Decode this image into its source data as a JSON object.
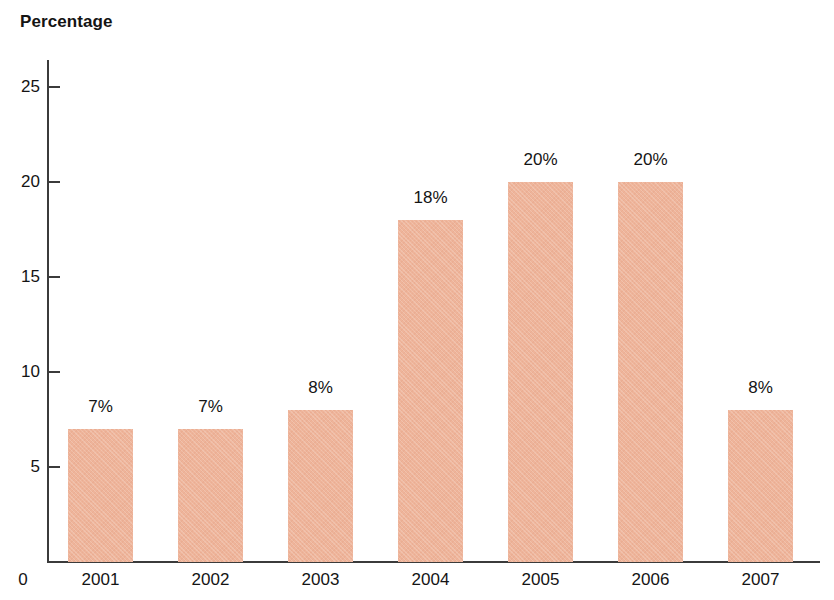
{
  "chart_data": {
    "type": "bar",
    "title": "Percentage",
    "xlabel": "",
    "ylabel": "Percentage",
    "categories": [
      "2001",
      "2002",
      "2003",
      "2004",
      "2005",
      "2006",
      "2007"
    ],
    "values": [
      7,
      7,
      8,
      18,
      20,
      20,
      8
    ],
    "value_labels": [
      "7%",
      "7%",
      "8%",
      "18%",
      "20%",
      "20%",
      "8%"
    ],
    "ylim": [
      0,
      25
    ],
    "yticks": [
      5,
      10,
      15,
      20,
      25
    ],
    "ytick_labels": [
      "5",
      "10",
      "15",
      "20",
      "25"
    ],
    "origin_label": "0",
    "grid": false,
    "legend": null,
    "bar_color": "#eeb49a",
    "axis_color": "#3b3b3b",
    "text_color": "#141414",
    "background_color": "#ffffff"
  }
}
